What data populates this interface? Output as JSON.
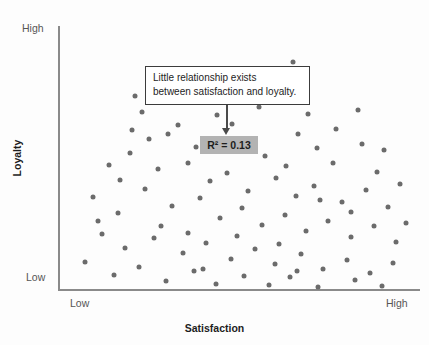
{
  "chart_data": {
    "type": "scatter",
    "title": "",
    "xlabel": "Satisfaction",
    "ylabel": "Loyalty",
    "x_tick_labels": [
      "Low",
      "High"
    ],
    "y_tick_labels": [
      "Low",
      "High"
    ],
    "xlim": [
      0,
      100
    ],
    "ylim": [
      0,
      100
    ],
    "grid": false,
    "legend": null,
    "annotations": [
      {
        "name": "callout",
        "lines": [
          "Little relationship exists",
          "between satisfaction and loyalty."
        ]
      },
      {
        "name": "r-squared",
        "text": "R² = 0.13",
        "value": 0.13
      }
    ],
    "series": [
      {
        "name": "respondents",
        "color": "#6b6b6b",
        "points": [
          [
            64.9,
            86.4
          ],
          [
            21.3,
            73.5
          ],
          [
            23.2,
            67.4
          ],
          [
            33.1,
            62.5
          ],
          [
            30.4,
            59.1
          ],
          [
            38.1,
            54.2
          ],
          [
            48.1,
            62.9
          ],
          [
            53.0,
            55.7
          ],
          [
            57.2,
            50.8
          ],
          [
            66.3,
            59.1
          ],
          [
            71.5,
            53.8
          ],
          [
            76.0,
            48.1
          ],
          [
            84.0,
            55.3
          ],
          [
            88.1,
            44.7
          ],
          [
            14.1,
            47.3
          ],
          [
            19.9,
            51.9
          ],
          [
            27.6,
            45.8
          ],
          [
            35.9,
            48.1
          ],
          [
            42.1,
            41.3
          ],
          [
            46.7,
            44.3
          ],
          [
            52.5,
            37.5
          ],
          [
            60.2,
            42.4
          ],
          [
            65.7,
            35.6
          ],
          [
            70.8,
            39.4
          ],
          [
            78.5,
            33.3
          ],
          [
            85.1,
            37.9
          ],
          [
            91.2,
            31.4
          ],
          [
            9.7,
            35.2
          ],
          [
            16.6,
            29.2
          ],
          [
            24.0,
            38.3
          ],
          [
            31.5,
            31.8
          ],
          [
            39.2,
            34.8
          ],
          [
            44.8,
            27.3
          ],
          [
            50.8,
            31.1
          ],
          [
            56.4,
            24.6
          ],
          [
            62.7,
            28.4
          ],
          [
            68.5,
            22.3
          ],
          [
            74.6,
            26.1
          ],
          [
            80.9,
            20.1
          ],
          [
            87.3,
            24.2
          ],
          [
            93.4,
            18.2
          ],
          [
            12.2,
            21.2
          ],
          [
            18.5,
            15.9
          ],
          [
            26.5,
            19.7
          ],
          [
            34.5,
            14.0
          ],
          [
            41.0,
            17.8
          ],
          [
            47.7,
            11.7
          ],
          [
            54.3,
            15.5
          ],
          [
            59.9,
            9.8
          ],
          [
            67.0,
            13.6
          ],
          [
            73.1,
            8.0
          ],
          [
            79.8,
            11.4
          ],
          [
            86.2,
            6.4
          ],
          [
            92.5,
            10.2
          ],
          [
            7.5,
            10.6
          ],
          [
            15.5,
            5.7
          ],
          [
            22.5,
            8.7
          ],
          [
            29.8,
            3.4
          ],
          [
            37.5,
            7.2
          ],
          [
            43.6,
            2.3
          ],
          [
            51.3,
            5.3
          ],
          [
            58.2,
            1.9
          ],
          [
            64.2,
            4.9
          ],
          [
            71.9,
            1.1
          ],
          [
            82.0,
            3.8
          ],
          [
            89.5,
            1.5
          ],
          [
            17.2,
            41.7
          ],
          [
            25.1,
            57.2
          ],
          [
            44.0,
            66.3
          ],
          [
            55.5,
            69.3
          ],
          [
            63.0,
            47.0
          ],
          [
            69.0,
            66.7
          ],
          [
            76.8,
            61.0
          ],
          [
            83.0,
            68.2
          ],
          [
            90.0,
            53.0
          ],
          [
            11.0,
            26.1
          ],
          [
            20.5,
            60.6
          ],
          [
            28.5,
            24.2
          ],
          [
            36.0,
            21.6
          ],
          [
            49.5,
            20.5
          ],
          [
            61.0,
            17.4
          ],
          [
            72.5,
            34.1
          ],
          [
            81.0,
            29.5
          ],
          [
            94.5,
            40.2
          ],
          [
            40.0,
            8.0
          ],
          [
            66.0,
            7.2
          ],
          [
            96.0,
            25.4
          ]
        ]
      }
    ]
  },
  "axes": {
    "y_high": "High",
    "y_low": "Low",
    "x_low": "Low",
    "x_high": "High",
    "x_title": "Satisfaction",
    "y_title": "Loyalty"
  },
  "callout": {
    "line1": "Little relationship exists",
    "line2": "between satisfaction and loyalty."
  },
  "r_squared": {
    "text": "R² = 0.13"
  }
}
